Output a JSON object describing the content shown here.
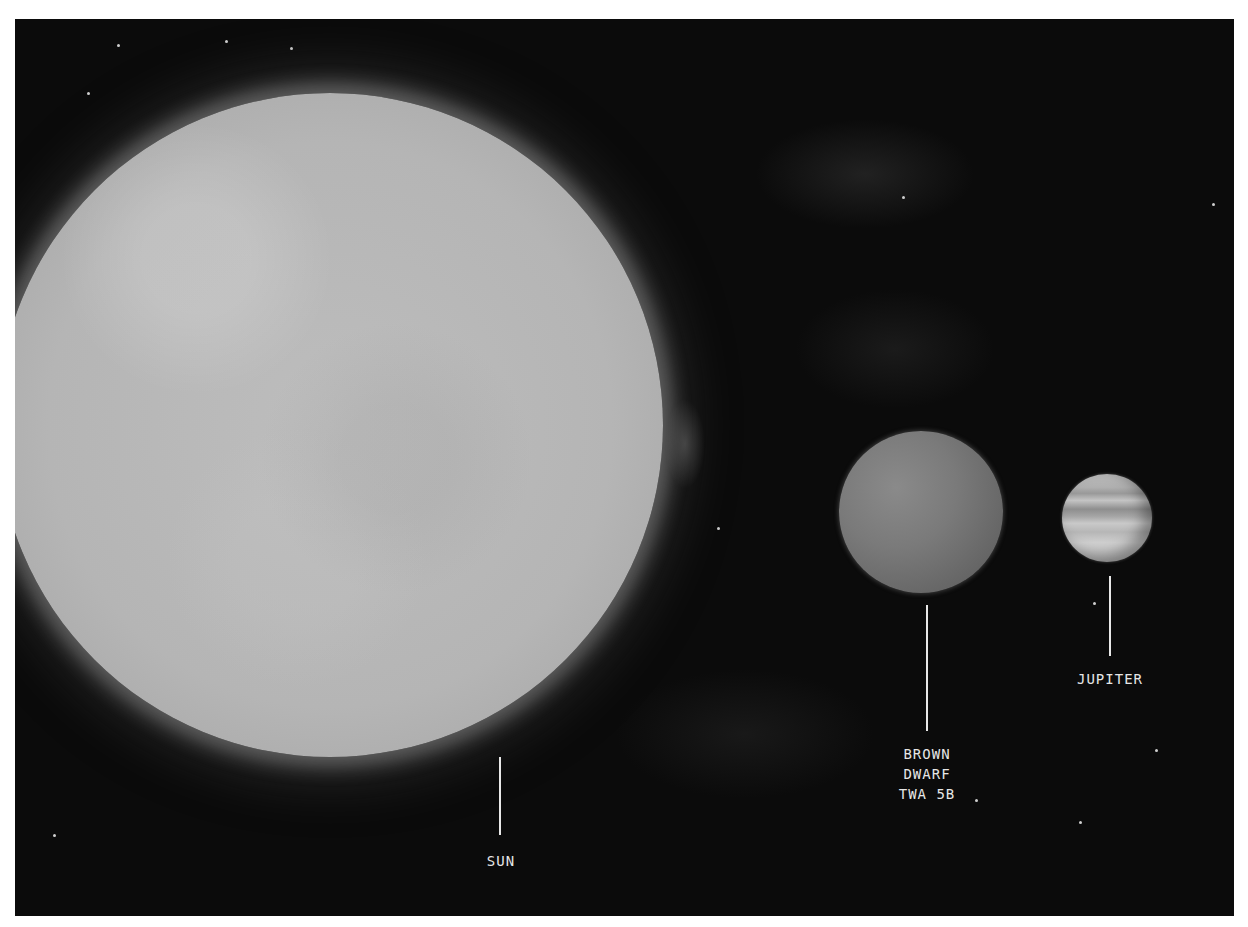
{
  "scene": {
    "title": "Size comparison: Sun, Brown Dwarf TWA 5B, Jupiter",
    "background_color": "#0b0b0b",
    "frame_color": "#ffffff"
  },
  "bodies": [
    {
      "id": "sun",
      "label": "SUN",
      "color": "#b8b8b8"
    },
    {
      "id": "brown-dwarf",
      "label_lines": [
        "BROWN",
        "DWARF",
        "TWA 5B"
      ],
      "label": "BROWN\nDWARF\nTWA 5B",
      "color": "#777777"
    },
    {
      "id": "jupiter",
      "label": "JUPITER",
      "color": "#bcbcbc"
    }
  ]
}
